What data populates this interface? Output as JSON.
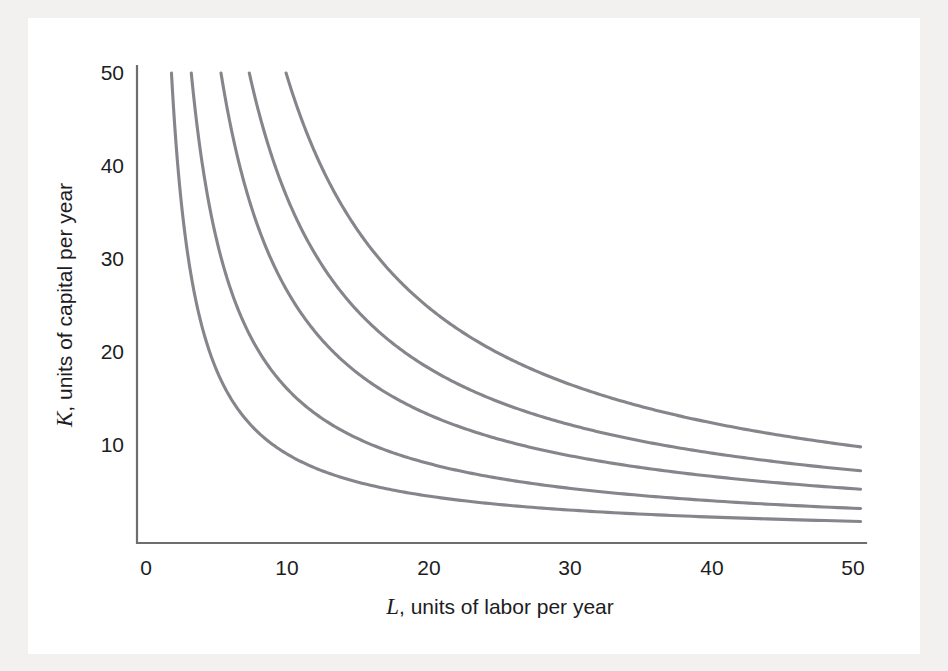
{
  "figure": {
    "background_color": "#f2f1ef",
    "plate_color": "#ffffff",
    "axis_color": "#6e6e72",
    "curve_color": "#85858b"
  },
  "chart_data": {
    "type": "line",
    "title": "",
    "subtitle": "",
    "xlabel_var": "L",
    "xlabel_rest": ", units of labor per year",
    "xlabel": "L, units of labor per year",
    "ylabel_var": "K",
    "ylabel_rest": ", units of capital per year",
    "ylabel": "K, units of capital per year",
    "xlim": [
      0,
      52
    ],
    "ylim": [
      0,
      52
    ],
    "xticks": [
      0,
      10,
      20,
      30,
      40,
      50
    ],
    "xtick_labels": [
      "0",
      "10",
      "20",
      "30",
      "40",
      "50"
    ],
    "yticks": [
      10,
      20,
      30,
      40,
      50
    ],
    "ytick_labels": [
      "10",
      "20",
      "30",
      "40",
      "50"
    ],
    "grid": false,
    "legend": false,
    "legend_position": "none",
    "annotations": [],
    "series_family": "isoquants K*L = constant",
    "series": [
      {
        "name": "isoquant-1",
        "constant": 90,
        "x_start": 1.8,
        "x_end": 50.5,
        "y_at_x50": 1.8,
        "points_x": [
          1.8,
          2,
          3,
          4,
          5,
          6,
          8,
          10,
          12,
          15,
          20,
          25,
          30,
          35,
          40,
          45,
          50.5
        ],
        "points_y": [
          50,
          45,
          30,
          22.5,
          18,
          15,
          11.3,
          9,
          7.5,
          6,
          4.5,
          3.6,
          3,
          2.6,
          2.25,
          2,
          1.8
        ]
      },
      {
        "name": "isoquant-2",
        "constant": 160,
        "x_start": 3.2,
        "x_end": 50.5,
        "y_at_x50": 3.2,
        "points_x": [
          3.2,
          4,
          5,
          6,
          8,
          10,
          12,
          15,
          20,
          25,
          30,
          35,
          40,
          45,
          50.5
        ],
        "points_y": [
          50,
          40,
          32,
          26.7,
          20,
          16,
          13.3,
          10.7,
          8,
          6.4,
          5.3,
          4.6,
          4,
          3.6,
          3.2
        ]
      },
      {
        "name": "isoquant-3",
        "constant": 265,
        "x_start": 5.3,
        "x_end": 50.5,
        "y_at_x50": 5.3,
        "points_x": [
          5.3,
          6,
          8,
          10,
          12,
          15,
          20,
          25,
          30,
          35,
          40,
          45,
          50.5
        ],
        "points_y": [
          50,
          44.2,
          33.1,
          26.5,
          22.1,
          17.7,
          13.3,
          10.6,
          8.8,
          7.6,
          6.6,
          5.9,
          5.3
        ]
      },
      {
        "name": "isoquant-4",
        "constant": 365,
        "x_start": 7.3,
        "x_end": 50.5,
        "y_at_x50": 7.3,
        "points_x": [
          7.3,
          8,
          10,
          12,
          15,
          20,
          25,
          30,
          35,
          40,
          45,
          50.5
        ],
        "points_y": [
          50,
          45.6,
          36.5,
          30.4,
          24.3,
          18.3,
          14.6,
          12.2,
          10.4,
          9.1,
          8.1,
          7.3
        ]
      },
      {
        "name": "isoquant-5",
        "constant": 495,
        "x_start": 9.9,
        "x_end": 50.5,
        "y_at_x50": 9.9,
        "points_x": [
          9.9,
          10,
          12,
          15,
          20,
          25,
          30,
          35,
          40,
          45,
          50.5
        ],
        "points_y": [
          50,
          49.5,
          41.3,
          33,
          24.8,
          19.8,
          16.5,
          14.1,
          12.4,
          11,
          9.9
        ]
      }
    ]
  }
}
